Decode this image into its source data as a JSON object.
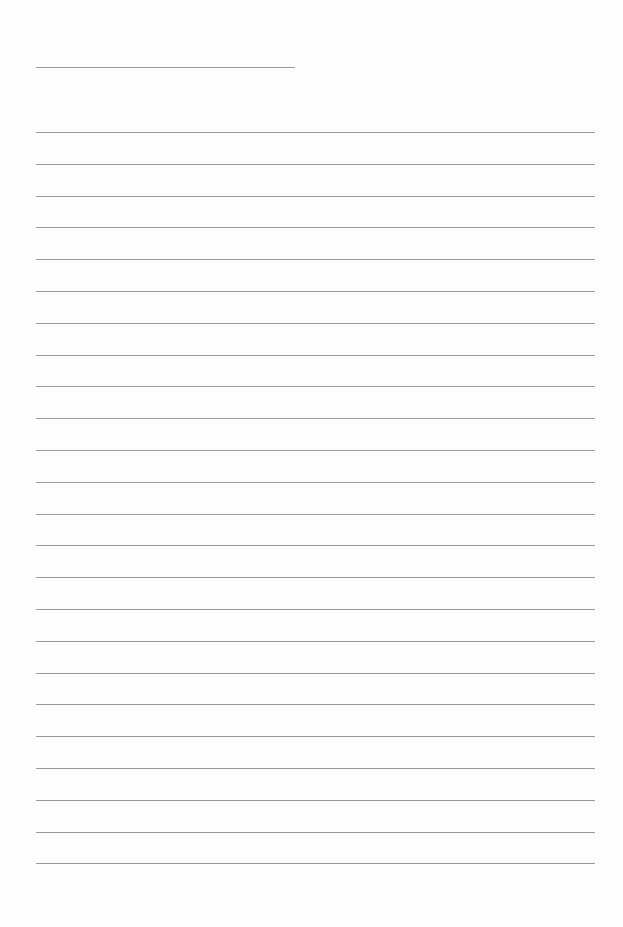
{
  "page": {
    "type": "blank lined paper",
    "background": "#fdfdfd",
    "line_color": "#9a9a9a",
    "header_line": {
      "x1": 36,
      "x2": 295,
      "y": 67
    },
    "ruled_lines": {
      "count": 24,
      "x1": 36,
      "x2": 595,
      "y_start": 132,
      "spacing": 31.8
    }
  }
}
